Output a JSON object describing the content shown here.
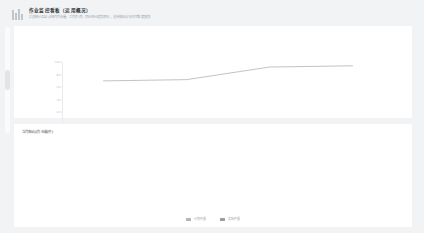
{
  "header": {
    "logo_icon": "bar-chart-logo-icon",
    "title": "作业监控看板（运用概况）",
    "subtitle": "汇总统计各站点每月作业量、工作负荷、同比环比趋势情况，支持按站点与时间维度查询"
  },
  "cards": {
    "line": {
      "title": ""
    },
    "bar": {
      "title": "当月各站点作业量(件)"
    }
  },
  "chart_data": [
    {
      "type": "line",
      "title": "",
      "xlabel": "",
      "ylabel": "",
      "x": [
        "2020-11",
        "2020-12",
        "2021-01",
        "2021-02"
      ],
      "categories": [
        "2020-11",
        "2020-12",
        "2021-01",
        "2021-02"
      ],
      "series": [
        {
          "name": "作业量",
          "values": [
            70,
            72,
            92,
            94
          ]
        }
      ],
      "values": [
        70,
        72,
        92,
        94
      ],
      "yticks": [
        0,
        20,
        40,
        60,
        80,
        100
      ],
      "ylim": [
        0,
        100
      ],
      "grid": false,
      "legend": "none",
      "line_color": "#b9bcc1"
    },
    {
      "type": "bar",
      "title": "当月各站点作业量(件)",
      "xlabel": "",
      "ylabel": "",
      "categories": [
        "2020-11",
        "2020-12",
        "2021-01",
        "2021-02"
      ],
      "series": [
        {
          "name": "计划件量",
          "values": [
            560,
            580,
            400,
            490
          ],
          "color": "#b3b6b9"
        },
        {
          "name": "实际件量",
          "values": [
            540,
            560,
            380,
            470
          ],
          "color": "#9a9da1"
        }
      ],
      "yticks": [
        0,
        100,
        200,
        300,
        400,
        500,
        600
      ],
      "ylim": [
        0,
        600
      ],
      "grid": false,
      "legend": "bottom"
    }
  ],
  "legend": {
    "items": [
      {
        "label": "计划件量",
        "color": "#b3b6b9"
      },
      {
        "label": "实际件量",
        "color": "#9a9da1"
      }
    ]
  },
  "scrollbar": {
    "name": "vertical-scrollbar"
  }
}
